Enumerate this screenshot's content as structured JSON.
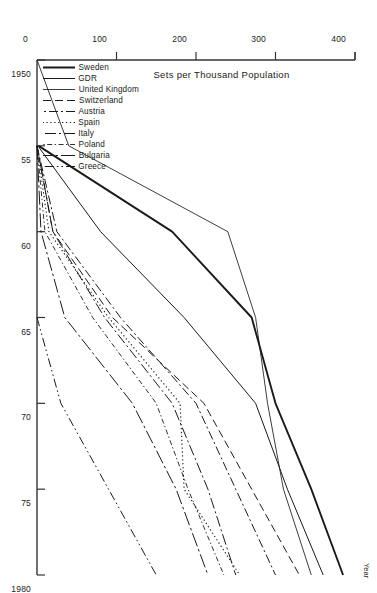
{
  "chart_data": {
    "type": "line",
    "title": "",
    "subtitle": "",
    "xlabel": "Year",
    "ylabel": "Sets per Thousand Population",
    "xlim": [
      1950,
      1980
    ],
    "ylim": [
      0,
      400
    ],
    "xticks": [
      1950,
      1955,
      1960,
      1965,
      1970,
      1975,
      1980
    ],
    "xticklabels": [
      "1950",
      "55",
      "60",
      "65",
      "70",
      "75",
      "1980"
    ],
    "yticks": [
      0,
      100,
      200,
      300,
      400
    ],
    "yticklabels": [
      "0",
      "100",
      "200",
      "300",
      "400"
    ],
    "grid": false,
    "legend_position": "lower-left-inside",
    "series": [
      {
        "name": "Sweden",
        "style": "solid-thick",
        "x": [
          1955,
          1960,
          1965,
          1970,
          1975,
          1980
        ],
        "y": [
          2,
          170,
          270,
          300,
          345,
          385
        ]
      },
      {
        "name": "GDR",
        "style": "solid-thin",
        "x": [
          1955,
          1960,
          1965,
          1970,
          1975,
          1980
        ],
        "y": [
          1,
          80,
          185,
          275,
          315,
          360
        ]
      },
      {
        "name": "United Kingdom",
        "style": "solid-thin-2",
        "x": [
          1950,
          1955,
          1960,
          1965,
          1970,
          1975,
          1980
        ],
        "y": [
          0,
          40,
          240,
          275,
          290,
          310,
          345
        ]
      },
      {
        "name": "Switzerland",
        "style": "dashed",
        "x": [
          1955,
          1960,
          1965,
          1970,
          1975,
          1980
        ],
        "y": [
          0,
          20,
          95,
          210,
          270,
          330
        ]
      },
      {
        "name": "Austria",
        "style": "dash-dot",
        "x": [
          1955,
          1960,
          1965,
          1970,
          1975,
          1980
        ],
        "y": [
          0,
          25,
          105,
          200,
          250,
          300
        ]
      },
      {
        "name": "Spain",
        "style": "dotted",
        "x": [
          1955,
          1960,
          1965,
          1970,
          1975,
          1980
        ],
        "y": [
          0,
          15,
          90,
          180,
          185,
          255
        ]
      },
      {
        "name": "Italy",
        "style": "dash-dot-long",
        "x": [
          1955,
          1960,
          1965,
          1970,
          1975,
          1980
        ],
        "y": [
          0,
          20,
          85,
          170,
          215,
          250
        ]
      },
      {
        "name": "Poland",
        "style": "fine-dash-dot",
        "x": [
          1955,
          1960,
          1965,
          1970,
          1975,
          1980
        ],
        "y": [
          0,
          10,
          70,
          150,
          190,
          235
        ]
      },
      {
        "name": "Bulgaria",
        "style": "long-dash-dot",
        "x": [
          1955,
          1960,
          1965,
          1970,
          1975,
          1980
        ],
        "y": [
          0,
          5,
          35,
          120,
          175,
          215
        ]
      },
      {
        "name": "Greece",
        "style": "dash-dot-dot",
        "x": [
          1965,
          1970,
          1975,
          1980
        ],
        "y": [
          0,
          30,
          90,
          150
        ]
      }
    ]
  },
  "axes": {
    "year_axis_title": "Year",
    "value_axis_title": "Sets per Thousand Population"
  }
}
